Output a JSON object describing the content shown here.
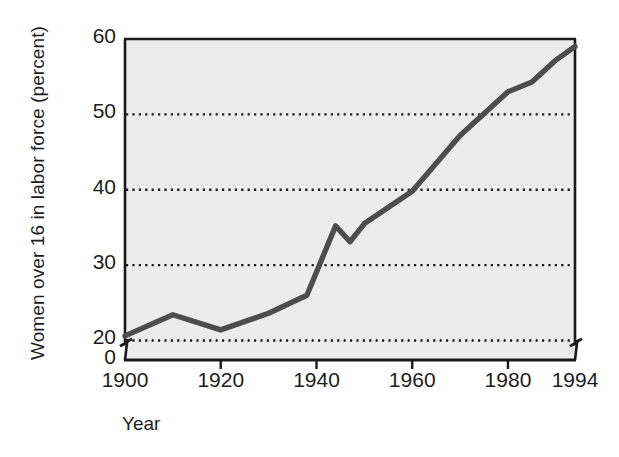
{
  "chart_data": {
    "type": "line",
    "title": "",
    "xlabel": "Year",
    "ylabel": "Women over 16 in labor force (percent)",
    "xlim": [
      1900,
      1994
    ],
    "ylim": [
      19,
      60
    ],
    "ylim_display": [
      0,
      60
    ],
    "axis_break": true,
    "grid": true,
    "grid_axis": "y",
    "grid_style": "dotted",
    "legend": "none",
    "xticks": [
      1900,
      1920,
      1940,
      1960,
      1980,
      1994
    ],
    "xtick_labels": [
      "1900",
      "1920",
      "1940",
      "1960",
      "1980",
      "1994"
    ],
    "yticks": [
      0,
      20,
      30,
      40,
      50,
      60
    ],
    "ytick_labels": [
      "0",
      "20",
      "30",
      "40",
      "50",
      "60"
    ],
    "gridline_values": [
      20,
      30,
      40,
      50
    ],
    "series": [
      {
        "name": "Women over 16 in labor force",
        "color": "#4d4d4d",
        "x": [
          1900,
          1910,
          1920,
          1930,
          1938,
          1944,
          1947,
          1950,
          1960,
          1970,
          1980,
          1985,
          1990,
          1994
        ],
        "values": [
          20.6,
          23.4,
          21.4,
          23.6,
          26.0,
          35.2,
          33.1,
          35.5,
          39.8,
          47.2,
          53.0,
          54.3,
          57.2,
          59.0
        ]
      }
    ],
    "colors": {
      "line": "#4d4d4d",
      "plot_background": "#ececec",
      "axis": "#1a1a1a",
      "grid": "#1a1a1a",
      "text": "#1d1d1d",
      "page_background": "#ffffff"
    },
    "geometry": {
      "plot_left": 125,
      "plot_right": 575,
      "plot_top": 39,
      "plot_bottom": 360,
      "y_value_top": 60,
      "y_value_at_plot_floor": 19,
      "break_y": 348
    }
  }
}
